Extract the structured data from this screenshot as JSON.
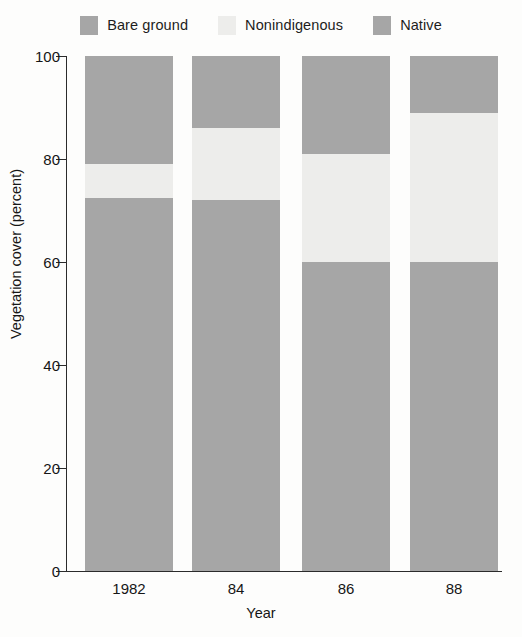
{
  "legend": {
    "items": [
      {
        "label": "Bare ground",
        "color": "#a6a6a6",
        "icon": "legend-swatch-icon"
      },
      {
        "label": "Nonindigenous",
        "color": "#ededeb",
        "icon": "legend-swatch-icon"
      },
      {
        "label": "Native",
        "color": "#a6a6a6",
        "icon": "legend-swatch-icon"
      }
    ]
  },
  "axes": {
    "y_title": "Vegetation cover (percent)",
    "x_title": "Year",
    "y_ticks": [
      "0",
      "20",
      "40",
      "60",
      "80",
      "100"
    ],
    "x_ticks": [
      "1982",
      "84",
      "86",
      "88"
    ]
  },
  "chart_data": {
    "type": "bar",
    "stacked": true,
    "title": "",
    "xlabel": "Year",
    "ylabel": "Vegetation cover (percent)",
    "categories": [
      "1982",
      "84",
      "86",
      "88"
    ],
    "ylim": [
      0,
      100
    ],
    "yticks": [
      0,
      20,
      40,
      60,
      80,
      100
    ],
    "grid": false,
    "legend_position": "top",
    "series": [
      {
        "name": "Native",
        "color": "#a6a6a6",
        "values": [
          72.5,
          72,
          60,
          60
        ]
      },
      {
        "name": "Nonindigenous",
        "color": "#ededeb",
        "values": [
          6.5,
          14,
          21,
          29
        ]
      },
      {
        "name": "Bare ground",
        "color": "#a6a6a6",
        "values": [
          21,
          14,
          19,
          11
        ]
      }
    ],
    "stack_tops": {
      "native": [
        72.5,
        72,
        60,
        60
      ],
      "native_plus_nonindigenous": [
        79,
        86,
        81,
        89
      ],
      "total": [
        100,
        100,
        100,
        100
      ]
    }
  }
}
